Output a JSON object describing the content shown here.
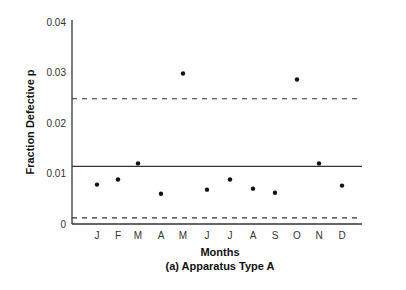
{
  "chart_data": {
    "type": "scatter",
    "title": "(a) Apparatus Type A",
    "xlabel": "Months",
    "ylabel": "Fraction Defective  p",
    "categories": [
      "J",
      "F",
      "M",
      "A",
      "M",
      "J",
      "J",
      "A",
      "S",
      "O",
      "N",
      "D"
    ],
    "values": [
      0.0078,
      0.0088,
      0.012,
      0.006,
      0.0298,
      0.0068,
      0.0088,
      0.007,
      0.0062,
      0.0286,
      0.012,
      0.0076
    ],
    "yticks": [
      "0",
      "0.01",
      "0.02",
      "0.03",
      "0.04"
    ],
    "ylim": [
      0,
      0.04
    ],
    "center_line": 0.0114,
    "upper_control_limit": 0.0248,
    "lower_control_limit": 0.0012,
    "grid": false,
    "legend": null
  }
}
